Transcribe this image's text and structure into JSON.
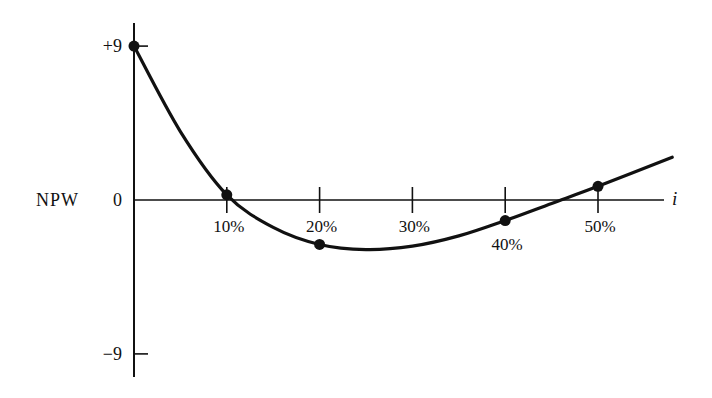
{
  "chart_data": {
    "type": "line",
    "title": "",
    "xlabel": "i",
    "ylabel": "NPW",
    "x_tick_labels": [
      "10%",
      "20%",
      "30%",
      "40%",
      "50%"
    ],
    "x_ticks": [
      10,
      20,
      30,
      40,
      50
    ],
    "y_tick_labels": [
      "+9",
      "0",
      "−9"
    ],
    "y_ticks": [
      9,
      0,
      -9
    ],
    "xlim": [
      0,
      58
    ],
    "ylim": [
      -10.5,
      10.5
    ],
    "grid": false,
    "legend": null,
    "series": [
      {
        "name": "NPW",
        "marked_points": [
          {
            "x": 0,
            "y": 9
          },
          {
            "x": 10,
            "y": 0.3
          },
          {
            "x": 20,
            "y": -2.6
          },
          {
            "x": 40,
            "y": -1.2
          },
          {
            "x": 50,
            "y": 0.8
          }
        ],
        "curve": [
          {
            "x": 0,
            "y": 9
          },
          {
            "x": 5,
            "y": 4
          },
          {
            "x": 10,
            "y": 0.3
          },
          {
            "x": 15,
            "y": -1.6
          },
          {
            "x": 20,
            "y": -2.6
          },
          {
            "x": 25,
            "y": -2.9
          },
          {
            "x": 30,
            "y": -2.7
          },
          {
            "x": 35,
            "y": -2.1
          },
          {
            "x": 40,
            "y": -1.2
          },
          {
            "x": 45,
            "y": -0.2
          },
          {
            "x": 50,
            "y": 0.8
          },
          {
            "x": 58,
            "y": 2.5
          }
        ]
      }
    ],
    "annotations": []
  }
}
